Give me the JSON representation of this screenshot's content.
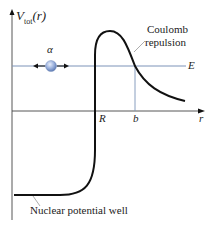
{
  "diagram": {
    "type": "potential-energy-diagram",
    "y_axis_label": {
      "main": "V",
      "subscript": "tot",
      "arg": "(r)"
    },
    "x_axis_label": "r",
    "energy_label": "E",
    "particle_label": "α",
    "marker_R": "R",
    "marker_b": "b",
    "annotations": {
      "coulomb_line1": "Coulomb",
      "coulomb_line2": "repulsion",
      "well": "Nuclear potential well"
    },
    "colors": {
      "curve": "#111111",
      "axes": "#333333",
      "energy_line": "#7c93b8",
      "particle": "#8aa6d6",
      "leader": "#888888"
    }
  }
}
